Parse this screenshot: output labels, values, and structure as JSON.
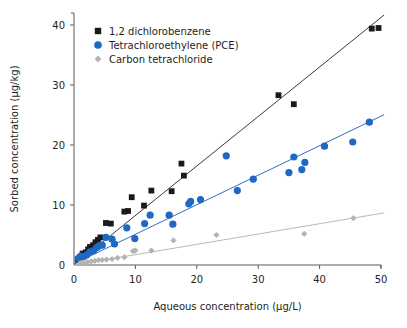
{
  "chart_data": {
    "type": "scatter",
    "title": "",
    "xlabel": "Aqueous concentration (µg/L)",
    "ylabel": "Sorbed concentration (µg/kg)",
    "xlim": [
      0,
      50
    ],
    "ylim": [
      0,
      42
    ],
    "xticks": [
      0,
      10,
      20,
      30,
      40,
      50
    ],
    "yticks": [
      0,
      10,
      20,
      30,
      40
    ],
    "xtick_labels": [
      "0",
      "10",
      "20",
      "30",
      "40",
      "50"
    ],
    "ytick_labels": [
      "0",
      "10",
      "20",
      "30",
      "40"
    ],
    "grid": false,
    "legend_position": "top-left",
    "series": [
      {
        "name": "1,2 dichlorobenzene",
        "marker": "square",
        "color": "#1a1a1a",
        "trendline": {
          "slope": 0.825,
          "intercept": 0.0,
          "color": "#3b3b3b",
          "x_start": 0,
          "x_end": 50.5
        },
        "points": [
          [
            0.6,
            0.9
          ],
          [
            1.0,
            1.3
          ],
          [
            1.4,
            1.9
          ],
          [
            1.9,
            2.1
          ],
          [
            2.3,
            2.6
          ],
          [
            2.6,
            3.0
          ],
          [
            3.1,
            3.3
          ],
          [
            3.5,
            3.8
          ],
          [
            3.9,
            4.2
          ],
          [
            4.3,
            4.6
          ],
          [
            5.2,
            7.0
          ],
          [
            6.0,
            6.9
          ],
          [
            8.2,
            8.9
          ],
          [
            8.8,
            9.0
          ],
          [
            9.4,
            11.3
          ],
          [
            11.4,
            9.9
          ],
          [
            12.6,
            12.4
          ],
          [
            15.9,
            12.3
          ],
          [
            17.5,
            16.9
          ],
          [
            17.9,
            14.9
          ],
          [
            33.3,
            28.3
          ],
          [
            35.8,
            26.8
          ],
          [
            48.5,
            39.4
          ],
          [
            49.6,
            39.5
          ]
        ]
      },
      {
        "name": "Tetrachloroethylene (PCE)",
        "marker": "circle",
        "color": "#1f68c4",
        "trendline": {
          "slope": 0.492,
          "intercept": 0.2,
          "color": "#2f6fc4",
          "x_start": 0,
          "x_end": 50.5
        },
        "points": [
          [
            0.7,
            1.1
          ],
          [
            1.1,
            1.5
          ],
          [
            1.6,
            1.4
          ],
          [
            2.1,
            1.7
          ],
          [
            2.6,
            2.2
          ],
          [
            3.2,
            2.4
          ],
          [
            3.7,
            2.9
          ],
          [
            4.1,
            3.2
          ],
          [
            4.6,
            3.3
          ],
          [
            5.2,
            4.6
          ],
          [
            6.2,
            4.3
          ],
          [
            6.6,
            3.5
          ],
          [
            8.6,
            6.2
          ],
          [
            9.9,
            4.4
          ],
          [
            11.5,
            6.9
          ],
          [
            12.4,
            8.3
          ],
          [
            15.5,
            8.3
          ],
          [
            16.1,
            6.8
          ],
          [
            18.7,
            10.2
          ],
          [
            19.0,
            10.6
          ],
          [
            20.6,
            10.9
          ],
          [
            24.8,
            18.2
          ],
          [
            26.6,
            12.4
          ],
          [
            29.2,
            14.3
          ],
          [
            35.0,
            15.4
          ],
          [
            35.8,
            18.0
          ],
          [
            37.1,
            15.9
          ],
          [
            37.6,
            17.1
          ],
          [
            40.8,
            19.8
          ],
          [
            45.4,
            20.5
          ],
          [
            48.1,
            23.8
          ]
        ]
      },
      {
        "name": "Carbon tetrachloride",
        "marker": "diamond",
        "color": "#b3b3b3",
        "trendline": {
          "slope": 0.172,
          "intercept": 0.0,
          "color": "#b9b9b9",
          "x_start": 0,
          "x_end": 50.5
        },
        "points": [
          [
            1.0,
            0.3
          ],
          [
            1.6,
            0.4
          ],
          [
            2.2,
            0.5
          ],
          [
            2.8,
            0.6
          ],
          [
            3.4,
            0.7
          ],
          [
            4.0,
            0.8
          ],
          [
            4.6,
            0.85
          ],
          [
            5.3,
            0.9
          ],
          [
            6.2,
            1.0
          ],
          [
            7.1,
            1.2
          ],
          [
            8.2,
            1.3
          ],
          [
            9.6,
            2.3
          ],
          [
            10.0,
            2.4
          ],
          [
            12.6,
            2.4
          ],
          [
            16.2,
            4.1
          ],
          [
            23.2,
            5.0
          ],
          [
            37.5,
            5.2
          ],
          [
            45.5,
            7.8
          ]
        ]
      }
    ],
    "legend": [
      {
        "label": "1,2 dichlorobenzene",
        "marker": "square",
        "color": "#1a1a1a"
      },
      {
        "label": "Tetrachloroethylene (PCE)",
        "marker": "circle",
        "color": "#1f68c4"
      },
      {
        "label": "Carbon tetrachloride",
        "marker": "diamond",
        "color": "#b3b3b3"
      }
    ]
  }
}
